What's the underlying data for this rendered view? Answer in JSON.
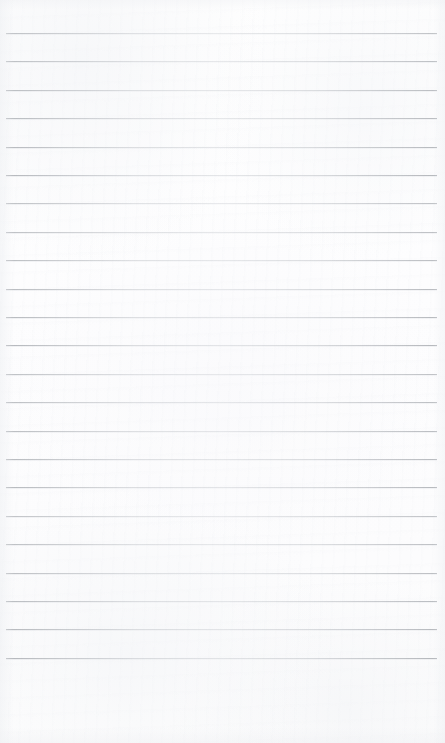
{
  "document": {
    "type": "ruled-notepad-page",
    "title": "Blank ruled paper page",
    "page_width": 445,
    "page_height": 743,
    "paper_color": "#fdfdfd",
    "rule_color": "#b4b8be",
    "content_text": "",
    "has_text": false,
    "has_margin_rule": false
  },
  "ruling": {
    "line_count": 23,
    "line_spacing": 28.4,
    "first_line_y": 33,
    "last_line_y": 657,
    "line_left_x": 6,
    "line_right_x": 437,
    "line_thickness": 1,
    "top_margin": 33,
    "bottom_margin": 86,
    "left_margin": 6,
    "right_margin": 8
  },
  "regions": {
    "top_margin_label": "top margin",
    "writing_area_label": "ruled writing area",
    "bottom_margin_label": "bottom margin"
  }
}
